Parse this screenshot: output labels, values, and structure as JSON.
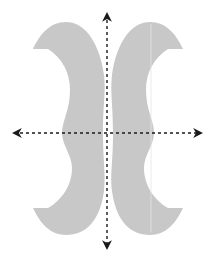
{
  "diagram": {
    "shape_color": "#c8c8c8",
    "axis_color": "#1a1a1a",
    "axes": [
      {
        "name": "vertical-axis",
        "style": "dashed",
        "arrows": "both"
      },
      {
        "name": "horizontal-axis",
        "style": "dashed",
        "arrows": "both"
      }
    ]
  }
}
